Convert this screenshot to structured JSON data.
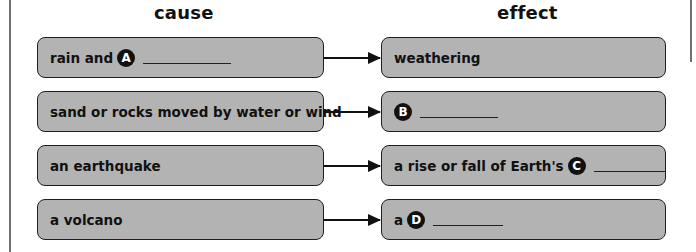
{
  "headers": {
    "cause": "cause",
    "effect": "effect"
  },
  "rows": [
    {
      "cause": {
        "text": "rain and",
        "marker": "A",
        "blank": true
      },
      "effect": {
        "text": "weathering"
      }
    },
    {
      "cause": {
        "text": "sand or rocks moved by water or wind"
      },
      "effect": {
        "text": "",
        "marker": "B",
        "blank": true
      }
    },
    {
      "cause": {
        "text": "an earthquake"
      },
      "effect": {
        "text": "a rise or fall of Earth's",
        "marker": "C",
        "blank": true
      }
    },
    {
      "cause": {
        "text": "a volcano"
      },
      "effect": {
        "text": "a",
        "marker": "D",
        "blank": true
      }
    }
  ],
  "colors": {
    "box_fill": "#b3b3b3",
    "box_border": "#1e1e1e",
    "marker_fill": "#111111",
    "marker_text": "#ffffff"
  },
  "icons": {
    "connector": "right-arrow-icon"
  }
}
